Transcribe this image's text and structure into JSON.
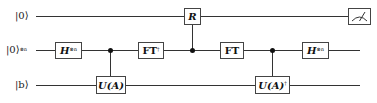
{
  "diagram": {
    "type": "quantum-circuit",
    "qubits": [
      {
        "id": "ancilla",
        "label": "|0⟩",
        "label_sup": ""
      },
      {
        "id": "clock",
        "label": "|0⟩",
        "label_sup": "⊗n"
      },
      {
        "id": "input",
        "label": "|b⟩",
        "label_sup": ""
      }
    ],
    "gates": [
      {
        "id": "h1",
        "name": "H",
        "sup": "⊗n",
        "target": "clock"
      },
      {
        "id": "ua",
        "name": "U(A)",
        "sup": "",
        "target": "input",
        "control": "clock"
      },
      {
        "id": "ftdag",
        "name": "FT",
        "sup": "†",
        "target": "clock"
      },
      {
        "id": "r",
        "name": "R",
        "sup": "",
        "target": "ancilla",
        "control": "clock"
      },
      {
        "id": "ft",
        "name": "FT",
        "sup": "",
        "target": "clock"
      },
      {
        "id": "uadag",
        "name": "U(A)",
        "sup": "†",
        "target": "input",
        "control": "clock"
      },
      {
        "id": "h2",
        "name": "H",
        "sup": "⊗n",
        "target": "clock"
      },
      {
        "id": "measure",
        "name": "measurement",
        "target": "ancilla"
      }
    ]
  }
}
